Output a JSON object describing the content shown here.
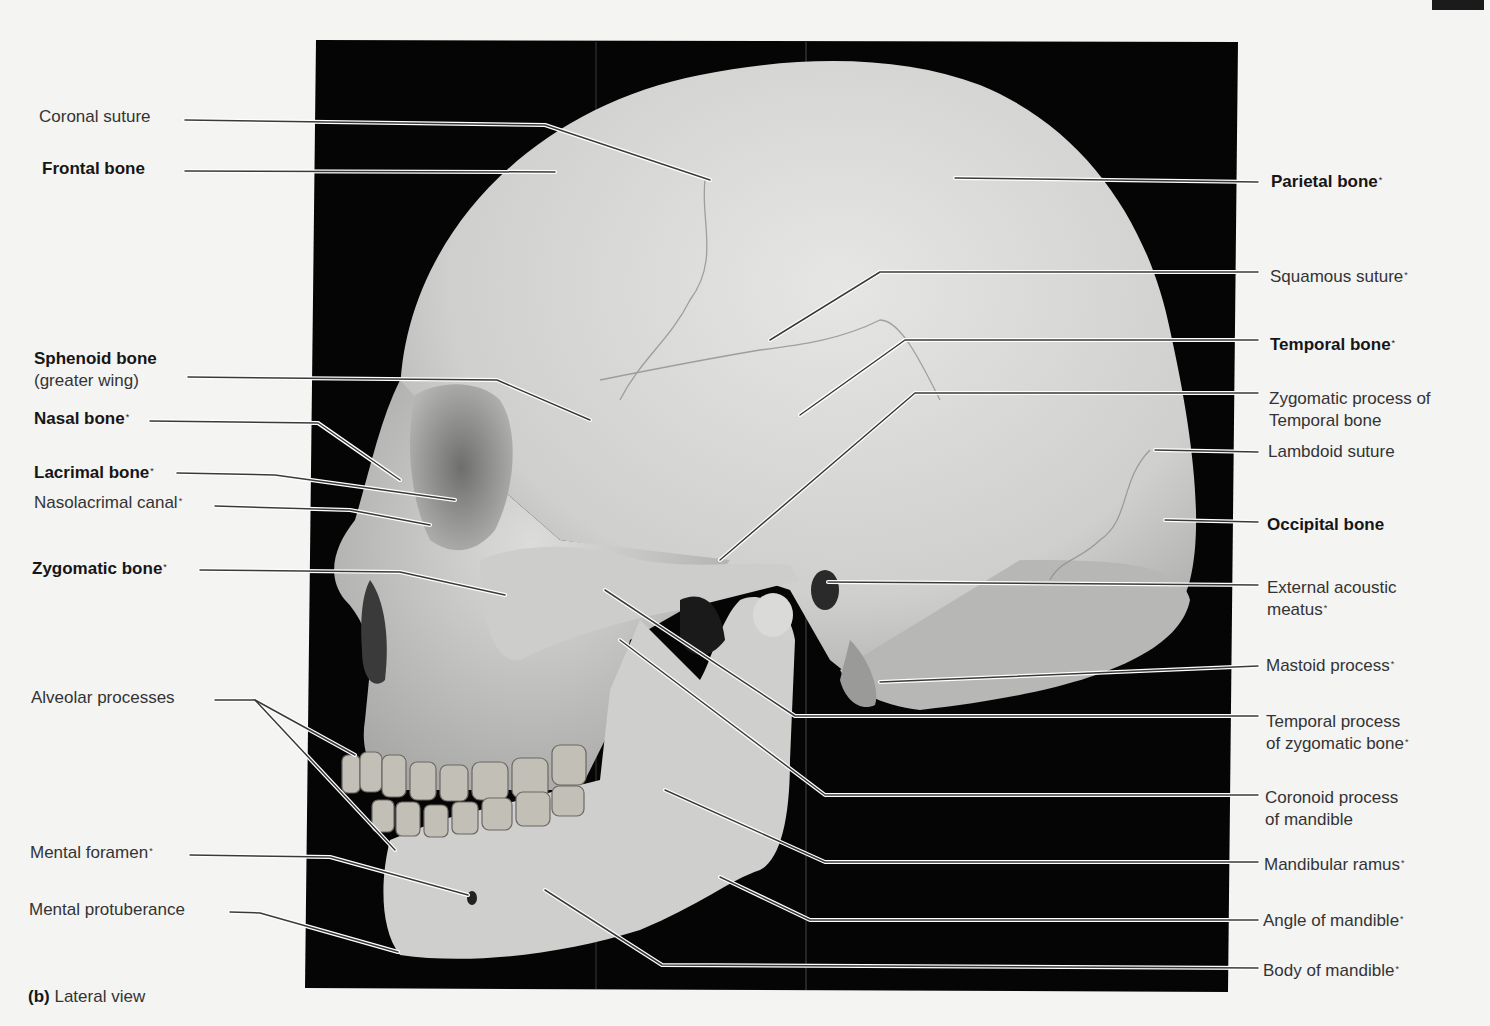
{
  "figure": {
    "caption_part": "(b)",
    "caption_text": " Lateral view",
    "page_number": "113",
    "colors": {
      "page_background": "#f4f4f3",
      "photo_background": "#000000",
      "bone": "#d8d8d6",
      "leader_dark": "#3a3a3a",
      "leader_light": "#ffffff"
    }
  },
  "labels": {
    "left": [
      {
        "id": "coronal-suture",
        "text": "Coronal suture",
        "bold": false,
        "asterisk": false
      },
      {
        "id": "frontal-bone",
        "text": "Frontal bone",
        "bold": true,
        "asterisk": false
      },
      {
        "id": "sphenoid-bone",
        "text": "Sphenoid bone",
        "sub": "(greater wing)",
        "bold": true,
        "asterisk": false
      },
      {
        "id": "nasal-bone",
        "text": "Nasal bone",
        "bold": true,
        "asterisk": true
      },
      {
        "id": "lacrimal-bone",
        "text": "Lacrimal bone",
        "bold": true,
        "asterisk": true
      },
      {
        "id": "nasolacrimal-canal",
        "text": "Nasolacrimal canal",
        "bold": false,
        "asterisk": true
      },
      {
        "id": "zygomatic-bone",
        "text": "Zygomatic bone",
        "bold": true,
        "asterisk": true
      },
      {
        "id": "alveolar-processes",
        "text": "Alveolar processes",
        "bold": false,
        "asterisk": false
      },
      {
        "id": "mental-foramen",
        "text": "Mental foramen",
        "bold": false,
        "asterisk": true
      },
      {
        "id": "mental-protuberance",
        "text": "Mental protuberance",
        "bold": false,
        "asterisk": false
      }
    ],
    "right": [
      {
        "id": "parietal-bone",
        "text": "Parietal bone",
        "bold": true,
        "asterisk": true
      },
      {
        "id": "squamous-suture",
        "text": "Squamous suture",
        "bold": false,
        "asterisk": true
      },
      {
        "id": "temporal-bone",
        "text": "Temporal bone",
        "bold": true,
        "asterisk": true
      },
      {
        "id": "zygomatic-process-temporal",
        "text": "Zygomatic process of",
        "sub": "Temporal bone",
        "bold": false,
        "asterisk": false
      },
      {
        "id": "lambdoid-suture",
        "text": "Lambdoid suture",
        "bold": false,
        "asterisk": false
      },
      {
        "id": "occipital-bone",
        "text": "Occipital bone",
        "bold": true,
        "asterisk": false
      },
      {
        "id": "external-acoustic-meatus",
        "text": "External acoustic",
        "sub": "meatus",
        "sub_asterisk": true,
        "bold": false,
        "asterisk": false
      },
      {
        "id": "mastoid-process",
        "text": "Mastoid process",
        "bold": false,
        "asterisk": true
      },
      {
        "id": "temporal-process-zygomatic",
        "text": "Temporal process",
        "sub": "of zygomatic bone",
        "sub_asterisk": true,
        "bold": false,
        "asterisk": false
      },
      {
        "id": "coronoid-process",
        "text": "Coronoid process",
        "sub": "of mandible",
        "bold": false,
        "asterisk": false
      },
      {
        "id": "mandibular-ramus",
        "text": "Mandibular ramus",
        "bold": false,
        "asterisk": true
      },
      {
        "id": "angle-of-mandible",
        "text": "Angle of mandible",
        "bold": false,
        "asterisk": true
      },
      {
        "id": "body-of-mandible",
        "text": "Body of mandible",
        "bold": false,
        "asterisk": true
      }
    ]
  },
  "asterisk_glyph": "*"
}
